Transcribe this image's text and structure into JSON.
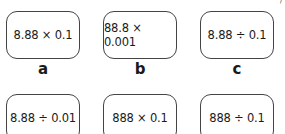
{
  "cards": [
    {
      "expr": "8.88 × 0.1",
      "label": "a"
    },
    {
      "expr": "88.8 × 0.001",
      "label": "b"
    },
    {
      "expr": "8.88 ÷ 0.1",
      "label": "c"
    },
    {
      "expr": "8.88 ÷ 0.01",
      "label": ""
    },
    {
      "expr": "888 × 0.1",
      "label": ""
    },
    {
      "expr": "888 ÷ 0.1",
      "label": ""
    }
  ],
  "corner_mark": "/"
}
